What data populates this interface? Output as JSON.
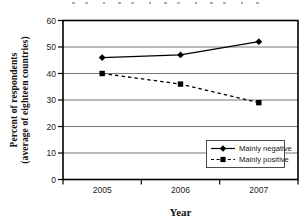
{
  "figure": {
    "y_axis_title": [
      "Percent of respondents",
      "(average of eighteen countries)"
    ],
    "x_axis_title": "Year"
  },
  "chart_data": {
    "type": "line",
    "title": "",
    "categories": [
      "2005",
      "2006",
      "2007"
    ],
    "series": [
      {
        "name": "Mainly negative",
        "values": [
          46,
          47,
          52
        ],
        "line_style": "solid",
        "marker": "diamond",
        "color": "#000000"
      },
      {
        "name": "Mainly positive",
        "values": [
          40,
          36,
          29
        ],
        "line_style": "dashed",
        "marker": "square",
        "color": "#000000"
      }
    ],
    "xlabel": "Year",
    "ylabel": "Percent of respondents (average of eighteen countries)",
    "ylim": [
      0,
      60
    ],
    "yticks": [
      0,
      10,
      20,
      30,
      40,
      50,
      60
    ],
    "grid": "horizontal-gridlines",
    "legend_position": "inside bottom-right",
    "colors": {
      "line": "#000000",
      "grid": "#777777",
      "axis": "#000000",
      "background": "#ffffff",
      "text": "#1a1a1a"
    }
  }
}
